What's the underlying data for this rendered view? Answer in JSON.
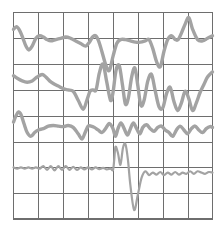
{
  "figure": {
    "title": "",
    "background_color": "#ffffff",
    "grid_color": "#6e6e6e",
    "trace_color": "#a3a3a3"
  },
  "chart_data": {
    "type": "line",
    "title": "",
    "subtitle": "",
    "xlabel": "",
    "ylabel": "",
    "xlim": [
      0,
      8
    ],
    "ylim": [
      0,
      8
    ],
    "grid": true,
    "grid_rows": 8,
    "grid_columns": 8,
    "legend": "none",
    "tick_labels_x": [],
    "tick_labels_y": [],
    "annotations": [],
    "series": [
      {
        "name": "trace-1",
        "line_color": "#a3a3a3",
        "line_width": 3.4,
        "baseline_y": 6.9,
        "x": [
          0.0,
          0.12,
          0.25,
          0.38,
          0.5,
          0.62,
          0.75,
          0.9,
          1.05,
          1.2,
          1.35,
          1.5,
          1.7,
          1.9,
          2.1,
          2.3,
          2.5,
          2.7,
          2.9,
          3.05,
          3.18,
          3.3,
          3.42,
          3.55,
          3.7,
          3.85,
          4.0,
          4.15,
          4.3,
          4.5,
          4.7,
          4.9,
          5.1,
          5.3,
          5.45,
          5.6,
          5.75,
          5.9,
          6.05,
          6.2,
          6.35,
          6.5,
          6.62,
          6.75,
          6.9,
          7.05,
          7.2,
          7.4,
          7.6,
          7.8,
          8.0
        ],
        "y": [
          7.35,
          7.45,
          7.3,
          7.0,
          6.7,
          6.55,
          6.7,
          7.0,
          7.1,
          7.05,
          6.95,
          6.9,
          6.95,
          7.0,
          7.05,
          7.0,
          6.9,
          6.8,
          6.7,
          6.85,
          7.05,
          7.1,
          6.9,
          6.5,
          6.0,
          5.75,
          6.3,
          6.8,
          6.95,
          6.95,
          6.9,
          6.85,
          6.85,
          6.9,
          6.95,
          6.6,
          6.1,
          5.9,
          6.5,
          6.95,
          7.1,
          6.95,
          6.95,
          7.2,
          7.55,
          7.8,
          7.35,
          6.95,
          6.9,
          7.0,
          7.1
        ]
      },
      {
        "name": "trace-2",
        "line_color": "#a3a3a3",
        "line_width": 3.4,
        "baseline_y": 5.3,
        "x": [
          0.0,
          0.15,
          0.35,
          0.55,
          0.75,
          0.95,
          1.15,
          1.3,
          1.45,
          1.6,
          1.8,
          2.0,
          2.2,
          2.4,
          2.6,
          2.8,
          2.95,
          3.08,
          3.2,
          3.32,
          3.45,
          3.6,
          3.75,
          3.9,
          4.0,
          4.12,
          4.25,
          4.38,
          4.5,
          4.62,
          4.75,
          4.88,
          5.0,
          5.12,
          5.25,
          5.4,
          5.55,
          5.7,
          5.85,
          6.0,
          6.15,
          6.3,
          6.45,
          6.6,
          6.75,
          6.9,
          7.05,
          7.2,
          7.35,
          7.5,
          7.65,
          7.8,
          8.0
        ],
        "y": [
          5.55,
          5.45,
          5.35,
          5.3,
          5.35,
          5.5,
          5.6,
          5.5,
          5.35,
          5.25,
          5.15,
          5.05,
          5.0,
          4.95,
          4.6,
          4.25,
          4.6,
          4.95,
          5.0,
          5.0,
          5.65,
          6.0,
          5.3,
          4.6,
          4.9,
          5.75,
          5.95,
          5.2,
          4.45,
          4.7,
          5.5,
          5.85,
          5.15,
          4.4,
          4.6,
          5.35,
          5.6,
          4.95,
          4.35,
          4.3,
          4.85,
          5.1,
          4.55,
          4.2,
          4.5,
          4.95,
          4.65,
          4.2,
          4.5,
          4.9,
          5.2,
          5.5,
          5.7
        ]
      },
      {
        "name": "trace-3",
        "line_color": "#a3a3a3",
        "line_width": 3.4,
        "baseline_y": 3.6,
        "x": [
          0.0,
          0.1,
          0.2,
          0.3,
          0.42,
          0.55,
          0.7,
          0.85,
          1.0,
          1.2,
          1.4,
          1.6,
          1.8,
          2.0,
          2.2,
          2.4,
          2.6,
          2.75,
          2.88,
          3.0,
          3.12,
          3.25,
          3.4,
          3.55,
          3.7,
          3.85,
          4.0,
          4.1,
          4.2,
          4.32,
          4.45,
          4.58,
          4.7,
          4.82,
          4.95,
          5.08,
          5.2,
          5.35,
          5.5,
          5.65,
          5.8,
          5.95,
          6.1,
          6.25,
          6.4,
          6.55,
          6.7,
          6.85,
          7.0,
          7.15,
          7.3,
          7.45,
          7.6,
          7.75,
          7.9,
          8.0
        ],
        "y": [
          3.75,
          4.0,
          4.15,
          4.05,
          3.7,
          3.35,
          3.2,
          3.35,
          3.45,
          3.5,
          3.6,
          3.62,
          3.6,
          3.58,
          3.62,
          3.55,
          3.3,
          3.1,
          3.35,
          3.6,
          3.6,
          3.55,
          3.45,
          3.35,
          3.5,
          3.7,
          3.5,
          3.2,
          3.5,
          3.72,
          3.5,
          3.25,
          3.5,
          3.72,
          3.5,
          3.3,
          3.55,
          3.65,
          3.5,
          3.4,
          3.55,
          3.6,
          3.45,
          3.35,
          3.2,
          3.45,
          3.6,
          3.45,
          3.3,
          3.5,
          3.6,
          3.45,
          3.35,
          3.5,
          3.58,
          3.55
        ]
      },
      {
        "name": "trace-4",
        "line_color": "#a3a3a3",
        "line_width": 2.2,
        "baseline_y": 1.9,
        "x": [
          0.0,
          0.15,
          0.3,
          0.45,
          0.6,
          0.75,
          0.9,
          1.05,
          1.2,
          1.35,
          1.5,
          1.65,
          1.8,
          1.95,
          2.1,
          2.25,
          2.4,
          2.55,
          2.7,
          2.85,
          3.0,
          3.15,
          3.3,
          3.45,
          3.6,
          3.75,
          3.9,
          4.0,
          4.05,
          4.1,
          4.2,
          4.3,
          4.4,
          4.5,
          4.6,
          4.7,
          4.85,
          5.0,
          5.15,
          5.3,
          5.45,
          5.6,
          5.75,
          5.9,
          6.05,
          6.2,
          6.35,
          6.5,
          6.65,
          6.8,
          6.95,
          7.1,
          7.25,
          7.4,
          7.55,
          7.7,
          7.85,
          8.0
        ],
        "y": [
          2.0,
          1.95,
          2.0,
          1.95,
          2.0,
          1.95,
          2.0,
          1.95,
          2.05,
          1.9,
          2.05,
          1.88,
          2.05,
          1.9,
          2.05,
          1.9,
          2.02,
          1.9,
          2.0,
          1.92,
          2.0,
          1.92,
          2.0,
          1.93,
          1.98,
          1.92,
          1.95,
          1.9,
          2.3,
          2.8,
          2.55,
          2.1,
          2.75,
          2.9,
          2.3,
          1.3,
          0.35,
          0.95,
          1.6,
          1.85,
          1.7,
          1.8,
          1.72,
          1.82,
          1.7,
          1.8,
          1.72,
          1.82,
          1.72,
          1.8,
          1.75,
          1.85,
          1.75,
          1.85,
          1.8,
          1.75,
          1.82,
          1.8
        ]
      }
    ]
  }
}
